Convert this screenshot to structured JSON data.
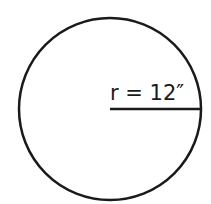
{
  "diagram": {
    "type": "circle-with-radius",
    "circle": {
      "cx": 110,
      "cy": 109,
      "r": 91,
      "stroke": "#1a1a1a",
      "stroke_width": 2.5
    },
    "radius_line": {
      "x1": 110,
      "y1": 109,
      "x2": 201,
      "y2": 109,
      "stroke": "#1a1a1a",
      "stroke_width": 2.5
    },
    "label": {
      "text": "r = 12″",
      "x": 110,
      "y": 100
    }
  }
}
